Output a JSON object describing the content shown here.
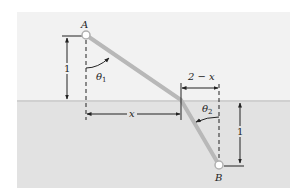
{
  "diagram": {
    "type": "refraction-path",
    "colors": {
      "air": "#f2f2f2",
      "water": "#e2e2e2",
      "surface_line": "#d4d4d4",
      "path": "#b8b8b8",
      "ink": "#222222"
    },
    "labels": {
      "point_a": "A",
      "point_b": "B",
      "theta1": "θ",
      "theta1_sub": "1",
      "theta2": "θ",
      "theta2_sub": "2",
      "x": "x",
      "two_minus_x": "2 − x",
      "height_a": "1",
      "depth_b": "1"
    }
  }
}
